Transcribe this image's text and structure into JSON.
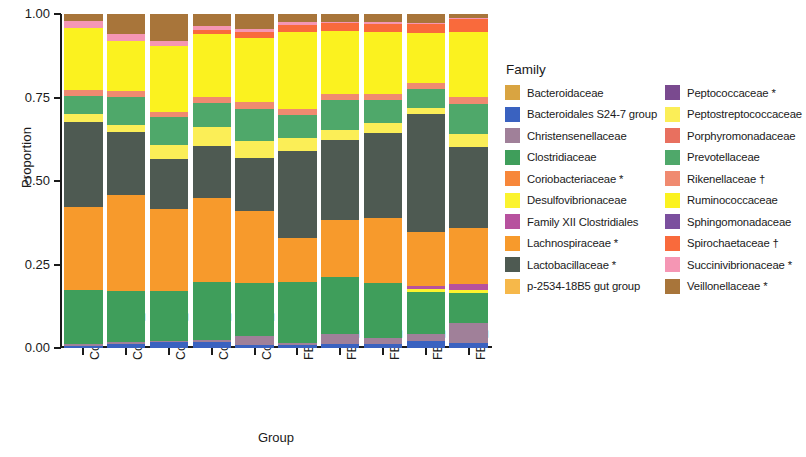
{
  "chart_data": {
    "type": "bar",
    "stacked": true,
    "title": "",
    "xlabel": "Group",
    "ylabel": "Proportion",
    "ylim": [
      0,
      1
    ],
    "ytick_labels": [
      "0.00",
      "0.25",
      "0.50",
      "0.75",
      "1.00"
    ],
    "ytick_values": [
      0,
      0.25,
      0.5,
      0.75,
      1.0
    ],
    "grid": false,
    "legend_title": "Family",
    "legend_position": "right",
    "categories": [
      "Control_D0",
      "Control_D08",
      "Control_D15",
      "Control_D22",
      "Control_D29",
      "FB1_D0",
      "FB1_D08",
      "FB1_D15",
      "FB1_D22",
      "FB1_D29"
    ],
    "series": [
      {
        "name": "Bacteroidaceae",
        "color": "#d9a441",
        "values": [
          0.0,
          0.0,
          0.0,
          0.0,
          0.0,
          0.0,
          0.0,
          0.0,
          0.0,
          0.0
        ]
      },
      {
        "name": "Bacteroidales S24-7 group",
        "color": "#3a62c0",
        "values": [
          0.005,
          0.013,
          0.017,
          0.018,
          0.01,
          0.01,
          0.012,
          0.012,
          0.022,
          0.015
        ]
      },
      {
        "name": "Christensenellaceae",
        "color": "#a08099",
        "values": [
          0.008,
          0.004,
          0.005,
          0.006,
          0.025,
          0.004,
          0.03,
          0.018,
          0.022,
          0.06
        ]
      },
      {
        "name": "Clostridiaceae",
        "color": "#3f9e5b",
        "values": [
          0.16,
          0.155,
          0.15,
          0.175,
          0.16,
          0.185,
          0.17,
          0.165,
          0.13,
          0.09
        ]
      },
      {
        "name": "Coriobacteriaceae *",
        "color": "#f7873a",
        "values": [
          0.0,
          0.0,
          0.0,
          0.0,
          0.0,
          0.0,
          0.0,
          0.0,
          0.0,
          0.0
        ]
      },
      {
        "name": "Desulfovibrionaceae",
        "color": "#fbf32e",
        "values": [
          0.0,
          0.0,
          0.0,
          0.0,
          0.0,
          0.0,
          0.0,
          0.0,
          0.008,
          0.01
        ]
      },
      {
        "name": "Family XII Clostridiales",
        "color": "#b7519e",
        "values": [
          0.0,
          0.0,
          0.0,
          0.0,
          0.0,
          0.0,
          0.0,
          0.0,
          0.01,
          0.018
        ]
      },
      {
        "name": "Lachnospiraceae *",
        "color": "#f79a2c",
        "values": [
          0.25,
          0.285,
          0.245,
          0.25,
          0.215,
          0.13,
          0.17,
          0.195,
          0.165,
          0.165
        ]
      },
      {
        "name": "Lactobacillaceae *",
        "color": "#4e5a52",
        "values": [
          0.255,
          0.19,
          0.15,
          0.155,
          0.16,
          0.26,
          0.24,
          0.255,
          0.365,
          0.245
        ]
      },
      {
        "name": "p-2534-18B5 gut group",
        "color": "#f6b84a",
        "values": [
          0.0,
          0.0,
          0.0,
          0.0,
          0.0,
          0.0,
          0.0,
          0.0,
          0.0,
          0.0
        ]
      },
      {
        "name": "Peptococcaceae *",
        "color": "#7a4a8f",
        "values": [
          0.0,
          0.0,
          0.0,
          0.0,
          0.0,
          0.0,
          0.0,
          0.0,
          0.0,
          0.0
        ]
      },
      {
        "name": "Peptostreptococcaceae",
        "color": "#fbee57",
        "values": [
          0.022,
          0.02,
          0.04,
          0.058,
          0.05,
          0.04,
          0.03,
          0.028,
          0.018,
          0.038
        ]
      },
      {
        "name": "Porphyromonadaceae",
        "color": "#e8705f",
        "values": [
          0.0,
          0.0,
          0.0,
          0.0,
          0.0,
          0.0,
          0.0,
          0.0,
          0.0,
          0.0
        ]
      },
      {
        "name": "Prevotellaceae",
        "color": "#4fa86a",
        "values": [
          0.055,
          0.085,
          0.085,
          0.073,
          0.095,
          0.07,
          0.09,
          0.07,
          0.06,
          0.09
        ]
      },
      {
        "name": "Rikenellaceae †",
        "color": "#f08a70",
        "values": [
          0.018,
          0.018,
          0.016,
          0.016,
          0.022,
          0.018,
          0.018,
          0.018,
          0.016,
          0.02
        ]
      },
      {
        "name": "Ruminococcaceae",
        "color": "#fbf21f",
        "values": [
          0.185,
          0.15,
          0.195,
          0.19,
          0.19,
          0.23,
          0.19,
          0.185,
          0.155,
          0.195
        ]
      },
      {
        "name": "Sphingomonadaceae",
        "color": "#7b4f9e",
        "values": [
          0.0,
          0.0,
          0.0,
          0.0,
          0.0,
          0.0,
          0.0,
          0.0,
          0.0,
          0.0
        ]
      },
      {
        "name": "Spirochaetaceae †",
        "color": "#f96a3c",
        "values": [
          0.0,
          0.0,
          0.0,
          0.01,
          0.018,
          0.02,
          0.022,
          0.025,
          0.03,
          0.04
        ]
      },
      {
        "name": "Succinivibrionaceae *",
        "color": "#f596b4",
        "values": [
          0.022,
          0.02,
          0.017,
          0.014,
          0.01,
          0.008,
          0.005,
          0.004,
          0.002,
          0.002
        ]
      },
      {
        "name": "Veillonellaceae *",
        "color": "#a8753a",
        "values": [
          0.02,
          0.06,
          0.08,
          0.035,
          0.045,
          0.025,
          0.023,
          0.025,
          0.027,
          0.012
        ]
      }
    ]
  },
  "legend": {
    "title": "Family",
    "columns": [
      [
        {
          "label": "Bacteroidaceae",
          "color": "#d9a441"
        },
        {
          "label": "Bacteroidales S24-7 group",
          "color": "#3a62c0"
        },
        {
          "label": "Christensenellaceae",
          "color": "#a08099"
        },
        {
          "label": "Clostridiaceae",
          "color": "#3f9e5b"
        },
        {
          "label": "Coriobacteriaceae *",
          "color": "#f7873a"
        },
        {
          "label": "Desulfovibrionaceae",
          "color": "#fbf32e"
        },
        {
          "label": "Family XII Clostridiales",
          "color": "#b7519e"
        },
        {
          "label": "Lachnospiraceae *",
          "color": "#f79a2c"
        },
        {
          "label": "Lactobacillaceae *",
          "color": "#4e5a52"
        },
        {
          "label": "p-2534-18B5 gut group",
          "color": "#f6b84a"
        }
      ],
      [
        {
          "label": "Peptococcaceae *",
          "color": "#7a4a8f"
        },
        {
          "label": "Peptostreptococcaceae",
          "color": "#fbee57"
        },
        {
          "label": "Porphyromonadaceae",
          "color": "#e8705f"
        },
        {
          "label": "Prevotellaceae",
          "color": "#4fa86a"
        },
        {
          "label": "Rikenellaceae †",
          "color": "#f08a70"
        },
        {
          "label": "Ruminococcaceae",
          "color": "#fbf21f"
        },
        {
          "label": "Sphingomonadaceae",
          "color": "#7b4f9e"
        },
        {
          "label": "Spirochaetaceae †",
          "color": "#f96a3c"
        },
        {
          "label": "Succinivibrionaceae *",
          "color": "#f596b4"
        },
        {
          "label": "Veillonellaceae *",
          "color": "#a8753a"
        }
      ]
    ]
  }
}
